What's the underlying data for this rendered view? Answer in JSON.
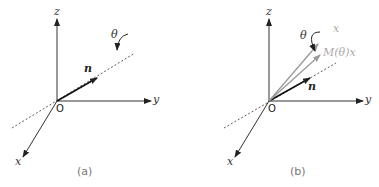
{
  "panel_a": {
    "caption": "(a)",
    "axis_labels": {
      "x": "x",
      "y": "y",
      "z": "z"
    },
    "origin_label": "O",
    "vector_label": "n",
    "angle_label": "θ"
  },
  "panel_b": {
    "caption": "(b)",
    "axis_labels": {
      "x": "x",
      "y": "y",
      "z": "z"
    },
    "origin_label": "O",
    "vector_label": "n",
    "angle_label": "θ",
    "x_vector_label": "x",
    "rotated_vector_label": "M(θ)x"
  },
  "colors": {
    "axis": "#333333",
    "gray_vector": "#999999",
    "gray_text": "#aaaaaa",
    "caption": "#777777"
  }
}
